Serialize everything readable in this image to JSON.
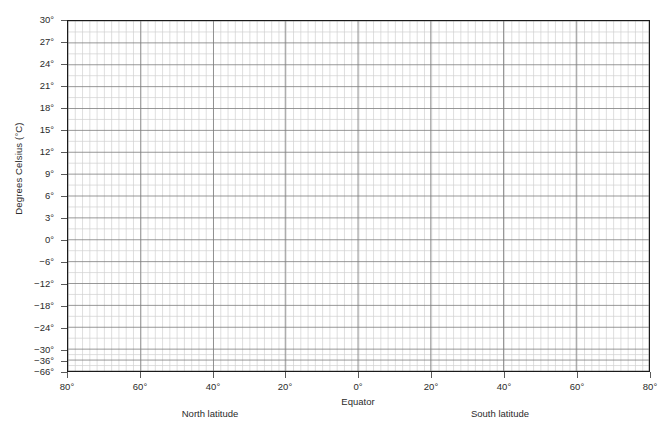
{
  "chart_data": {
    "type": "line",
    "title": "",
    "subtitle": "",
    "xlabel": "Equator",
    "ylabel": "Degrees Celsius (°C)",
    "grid": true,
    "legend": null,
    "series": [],
    "note": "Blank graph-paper template: gridded plot area with no data plotted.",
    "x_axis": {
      "label_left": "North latitude",
      "label_center": "Equator",
      "label_right": "South latitude",
      "ticks": [
        {
          "label": "80°",
          "value": -80,
          "px": 67
        },
        {
          "label": "60°",
          "value": -60,
          "px": 140
        },
        {
          "label": "40°",
          "value": -40,
          "px": 213
        },
        {
          "label": "20°",
          "value": -20,
          "px": 285
        },
        {
          "label": "0°",
          "value": 0,
          "px": 358
        },
        {
          "label": "20°",
          "value": 20,
          "px": 431
        },
        {
          "label": "40°",
          "value": 40,
          "px": 504
        },
        {
          "label": "60°",
          "value": 60,
          "px": 577
        },
        {
          "label": "80°",
          "value": 80,
          "px": 650
        }
      ],
      "minor_step_degrees": 2,
      "range": [
        -80,
        80
      ]
    },
    "y_axis": {
      "title": "Degrees Celsius (°C)",
      "ticks": [
        {
          "label": "30°",
          "value": 30,
          "px": 20
        },
        {
          "label": "27°",
          "value": 27,
          "px": 42
        },
        {
          "label": "24°",
          "value": 24,
          "px": 64
        },
        {
          "label": "21°",
          "value": 21,
          "px": 86
        },
        {
          "label": "18°",
          "value": 18,
          "px": 108
        },
        {
          "label": "15°",
          "value": 15,
          "px": 130
        },
        {
          "label": "12°",
          "value": 12,
          "px": 152
        },
        {
          "label": "9°",
          "value": 9,
          "px": 174
        },
        {
          "label": "6°",
          "value": 6,
          "px": 196
        },
        {
          "label": "3°",
          "value": 3,
          "px": 218
        },
        {
          "label": "0°",
          "value": 0,
          "px": 240
        },
        {
          "label": "−6°",
          "value": -6,
          "px": 262
        },
        {
          "label": "−12°",
          "value": -12,
          "px": 284
        },
        {
          "label": "−18°",
          "value": -18,
          "px": 306
        },
        {
          "label": "−24°",
          "value": -24,
          "px": 328
        },
        {
          "label": "−30°",
          "value": -30,
          "px": 350
        },
        {
          "label": "−36°",
          "value": -36,
          "px": 361
        },
        {
          "label": "−66°",
          "value": -66,
          "px": 372
        }
      ],
      "range": [
        -66,
        30
      ],
      "broken_scale": true
    },
    "colors": {
      "background": "#ffffff",
      "frame": "#1a1a1a",
      "grid_major": "#7d7d7d",
      "grid_minor": "#cfcfcf",
      "text": "#2b2b2b"
    }
  }
}
